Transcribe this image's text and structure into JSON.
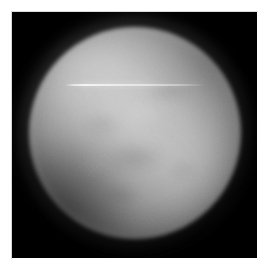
{
  "image": {
    "kind": "astronomical-disk-photograph",
    "subject_label": "planetary disk",
    "matte_color": "#ffffff",
    "frame_color": "#000000",
    "frame": {
      "x": 12,
      "y": 12,
      "width": 245,
      "height": 246
    },
    "alt_text": "Grayscale telescope image of a bright fuzzy planetary disk on a black sky background"
  },
  "disk": {
    "center_x": 133,
    "center_y": 133,
    "radius": 106,
    "peak_brightness_hex": "#ececec",
    "mid_brightness_hex": "#c2c2c2",
    "limb_brightness_hex": "#4b4b4b",
    "background_hex": "#000000",
    "core_offset_x_pct": 47,
    "core_offset_y_pct": 45
  },
  "features": [
    {
      "name": "bright-core",
      "position": "upper-left-of-center",
      "tone": "bright"
    },
    {
      "name": "dark-limb-southwest",
      "position": "lower-left",
      "tone": "dark"
    },
    {
      "name": "dark-limb-northeast",
      "position": "upper-right",
      "tone": "dark"
    },
    {
      "name": "equatorial-dark-band",
      "position": "lower-center",
      "tone": "slightly-dark"
    }
  ],
  "artifact": {
    "name": "horizontal-streak",
    "description": "thin bright horizontal line artifact",
    "start_x": 65,
    "end_x": 205,
    "y": 84,
    "color_hex": "#ffffff"
  }
}
